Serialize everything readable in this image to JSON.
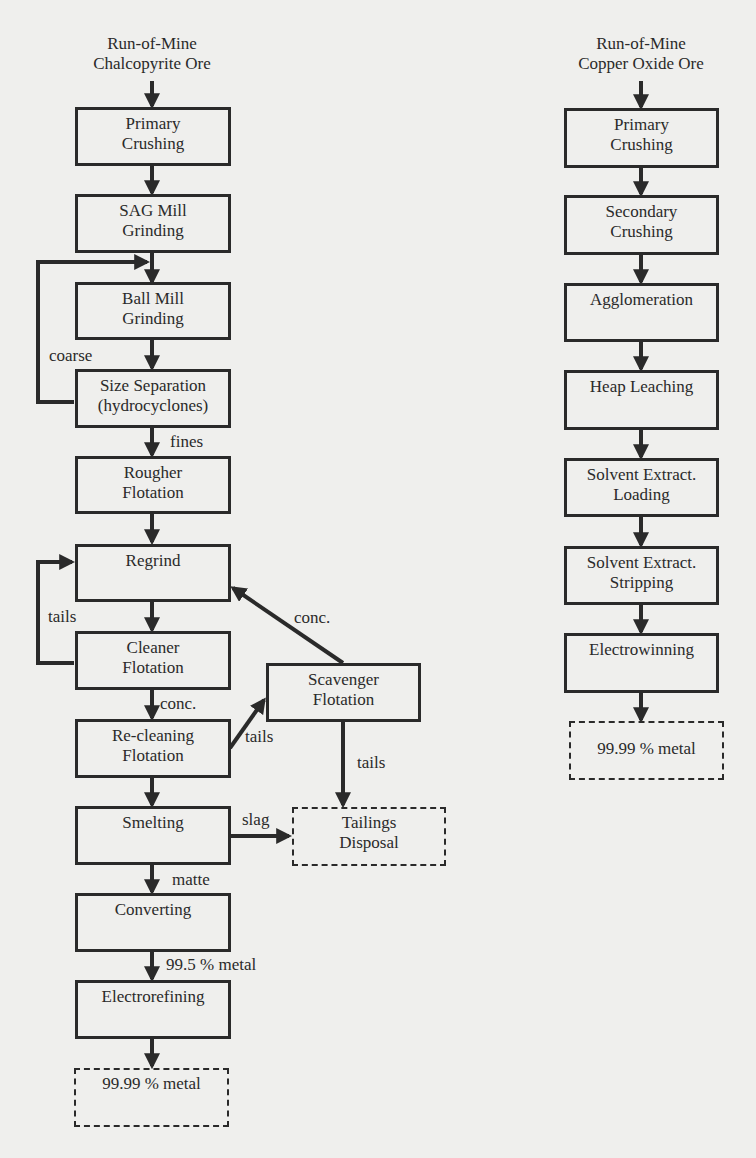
{
  "diagram": {
    "colors": {
      "line": "#2a2a2a",
      "background": "#efefed"
    },
    "left_flow": {
      "source": "Run-of-Mine\nChalcopyrite Ore",
      "steps": {
        "primary_crushing": "Primary\nCrushing",
        "sag_mill": "SAG Mill\nGrinding",
        "ball_mill": "Ball Mill\nGrinding",
        "size_separation": "Size Separation\n(hydrocyclones)",
        "rougher": "Rougher\nFlotation",
        "regrind": "Regrind",
        "cleaner": "Cleaner\nFlotation",
        "recleaning": "Re-cleaning\nFlotation",
        "scavenger": "Scavenger\nFlotation",
        "smelting": "Smelting",
        "tailings": "Tailings\nDisposal",
        "converting": "Converting",
        "electrorefining": "Electrorefining",
        "product": "99.99 % metal"
      },
      "labels": {
        "coarse": "coarse",
        "fines": "fines",
        "tails_loop": "tails",
        "conc_cleaner": "conc.",
        "tails_recleaning": "tails",
        "conc_scavenger": "conc.",
        "tails_scavenger": "tails",
        "slag": "slag",
        "matte": "matte",
        "blister": "99.5 % metal"
      }
    },
    "right_flow": {
      "source": "Run-of-Mine\nCopper Oxide Ore",
      "steps": {
        "primary_crushing": "Primary\nCrushing",
        "secondary_crushing": "Secondary\nCrushing",
        "agglomeration": "Agglomeration",
        "heap_leaching": "Heap Leaching",
        "sx_loading": "Solvent Extract.\nLoading",
        "sx_stripping": "Solvent Extract.\nStripping",
        "electrowinning": "Electrowinning",
        "product": "99.99 % metal"
      }
    }
  }
}
